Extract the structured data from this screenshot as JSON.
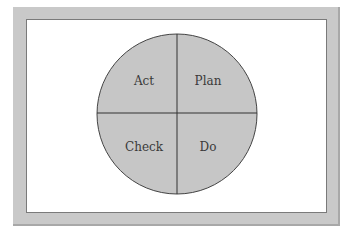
{
  "diagram": {
    "quadrants": [
      {
        "position": "top-left",
        "label": "Act"
      },
      {
        "position": "top-right",
        "label": "Plan"
      },
      {
        "position": "bottom-left",
        "label": "Check"
      },
      {
        "position": "bottom-right",
        "label": "Do"
      }
    ],
    "colors": {
      "frame": "#c9c9c9",
      "panel": "#ffffff",
      "circle_fill": "#c6c6c6",
      "lines": "#333333"
    }
  }
}
